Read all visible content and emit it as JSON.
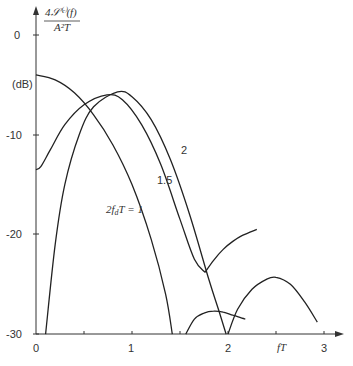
{
  "chart_data": {
    "type": "line",
    "title": "",
    "ylabel": "4𝒮(c)(f) / A²T (dB)",
    "ylabel_top": "4𝒮⁽ᶜ⁾(f)",
    "ylabel_bottom": "A²T",
    "ylabel_unit": "(dB)",
    "xlabel": "fT",
    "xlim": [
      0,
      3.2
    ],
    "ylim": [
      -30,
      2
    ],
    "xticks": [
      0,
      1,
      2,
      3
    ],
    "xminor_ticks": [
      0.5,
      1.5,
      2.5
    ],
    "yticks": [
      0,
      -10,
      -20,
      -30
    ],
    "ytick_labels": [
      "0",
      "-10",
      "-20",
      "-30"
    ],
    "xtick_labels": [
      "0",
      "1",
      "2",
      "3"
    ],
    "grid": false,
    "series": [
      {
        "name": "2f_dT = 1",
        "label": "2f_dT = 1",
        "segments": [
          {
            "x": [
              0,
              0.2,
              0.4,
              0.6,
              0.8,
              1.0,
              1.2,
              1.35,
              1.42
            ],
            "y": [
              -4.0,
              -4.5,
              -5.8,
              -8.0,
              -11.0,
              -15.0,
              -20.5,
              -26.0,
              -30.0
            ]
          },
          {
            "x": [
              1.56,
              1.65,
              1.75,
              1.85,
              1.95,
              2.05,
              2.18
            ],
            "y": [
              -30.0,
              -28.5,
              -27.9,
              -27.7,
              -27.8,
              -28.1,
              -28.5
            ]
          }
        ]
      },
      {
        "name": "1.5",
        "label": "1.5",
        "segments": [
          {
            "x": [
              0,
              0.05,
              0.15,
              0.3,
              0.5,
              0.74,
              0.9,
              1.1,
              1.3,
              1.5,
              1.65,
              1.76
            ],
            "y": [
              -13.5,
              -13.2,
              -11.5,
              -9.0,
              -7.0,
              -6.0,
              -6.5,
              -9.0,
              -13.0,
              -18.5,
              -22.5,
              -23.8
            ]
          },
          {
            "x": [
              1.76,
              1.85,
              1.95,
              2.05,
              2.15,
              2.3
            ],
            "y": [
              -23.8,
              -22.6,
              -21.5,
              -20.7,
              -20.1,
              -19.5
            ]
          }
        ]
      },
      {
        "name": "2",
        "label": "2",
        "segments": [
          {
            "x": [
              0.1,
              0.2,
              0.3,
              0.45,
              0.6,
              0.85,
              1.0,
              1.2,
              1.4,
              1.6,
              1.8,
              1.9,
              1.98
            ],
            "y": [
              -30.0,
              -21.0,
              -15.0,
              -10.0,
              -7.2,
              -5.7,
              -6.2,
              -8.5,
              -12.5,
              -18.0,
              -24.5,
              -27.5,
              -30.0
            ]
          },
          {
            "x": [
              2.0,
              2.1,
              2.25,
              2.4,
              2.5,
              2.65,
              2.8,
              2.93
            ],
            "y": [
              -30.0,
              -27.5,
              -25.5,
              -24.5,
              -24.3,
              -25.0,
              -26.8,
              -28.8
            ]
          }
        ]
      }
    ]
  },
  "labels": {
    "y_numerator": "4𝒮⁽ᶜ⁾(f)",
    "y_denominator": "A²T",
    "y_unit": "(dB)",
    "x_axis": "fT",
    "curve_1": "2f",
    "curve_1_sub": "d",
    "curve_1_rest": "T = 1",
    "curve_15": "1.5",
    "curve_2": "2",
    "yt0": "0",
    "yt10": "-10",
    "yt20": "-20",
    "yt30": "-30",
    "xt0": "0",
    "xt1": "1",
    "xt2": "2",
    "xt3": "3"
  }
}
